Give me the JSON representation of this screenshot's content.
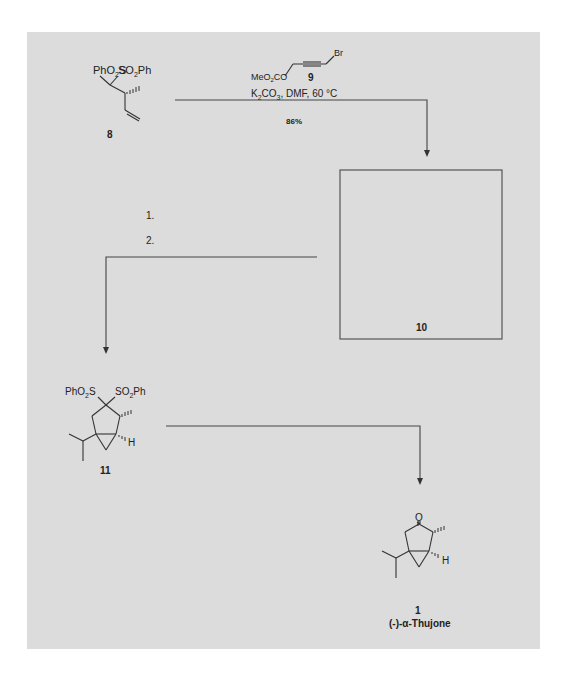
{
  "scheme": {
    "compounds": [
      {
        "id": "8",
        "label": "8",
        "substituents": [
          "PhO2S",
          "SO2Ph"
        ]
      },
      {
        "id": "9",
        "label": "9",
        "fragments": [
          "MeO2CO",
          "Br"
        ]
      },
      {
        "id": "10",
        "label": "10",
        "note": "empty structure box"
      },
      {
        "id": "11",
        "label": "11",
        "substituents": [
          "PhO2S",
          "SO2Ph",
          "H"
        ]
      },
      {
        "id": "1",
        "label": "1",
        "name": "(-)-α-Thujone",
        "substituents": [
          "O",
          "H"
        ]
      }
    ],
    "step1": {
      "reagent_label": "9",
      "conditions": "K2CO3, DMF, 60 °C",
      "conditions_parts": {
        "k": "K",
        "sub2": "2",
        "co": "CO",
        "sub3": "3",
        "rest": ", DMF, 60 °C"
      },
      "yield": "86%"
    },
    "step2": {
      "items": [
        "1.",
        "2."
      ]
    },
    "step3": {},
    "labels": {
      "c8_left_ph": "PhO",
      "c8_left_s": "S",
      "c8_right_so": "SO",
      "c8_right_ph": "Ph",
      "c9_meo": "MeO",
      "c9_co": "CO",
      "c9_br": "Br",
      "c11_left_ph": "PhO",
      "c11_left_s": "S",
      "c11_right_so": "SO",
      "c11_right_ph": "Ph",
      "c11_h": "H",
      "c1_o": "O",
      "c1_h": "H",
      "sub2": "2",
      "product_name": "(-)-α-Thujone"
    }
  }
}
